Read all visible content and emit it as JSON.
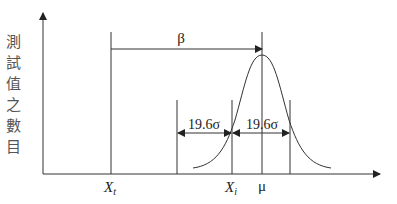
{
  "diagram": {
    "y_axis_label": "測試值之數目",
    "labels": {
      "beta": "β",
      "left_interval": "19.6σ",
      "right_interval": "19.6σ",
      "x_t": "X",
      "x_t_sub": "t",
      "x_i": "X",
      "x_i_sub": "i",
      "mu": "μ"
    },
    "colors": {
      "stroke": "#333333",
      "text": "#222222"
    }
  }
}
